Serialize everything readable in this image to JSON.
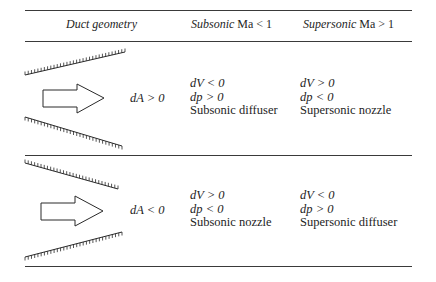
{
  "table": {
    "headers": {
      "geometry": "Duct geometry",
      "subsonic_word": "Subsonic",
      "subsonic_cond": "Ma < 1",
      "supersonic_word": "Supersonic",
      "supersonic_cond": "Ma > 1"
    },
    "rows": [
      {
        "geometry": "diverging",
        "area_change": "dA > 0",
        "subsonic": {
          "dV": "dV < 0",
          "dp": "dp > 0",
          "label": "Subsonic diffuser"
        },
        "supersonic": {
          "dV": "dV > 0",
          "dp": "dp < 0",
          "label": "Supersonic nozzle"
        }
      },
      {
        "geometry": "converging",
        "area_change": "dA < 0",
        "subsonic": {
          "dV": "dV > 0",
          "dp": "dp < 0",
          "label": "Subsonic nozzle"
        },
        "supersonic": {
          "dV": "dV < 0",
          "dp": "dp > 0",
          "label": "Supersonic diffuser"
        }
      }
    ]
  },
  "icons": {
    "flow_arrow": "right-block-arrow",
    "wall": "hatched-wall"
  }
}
